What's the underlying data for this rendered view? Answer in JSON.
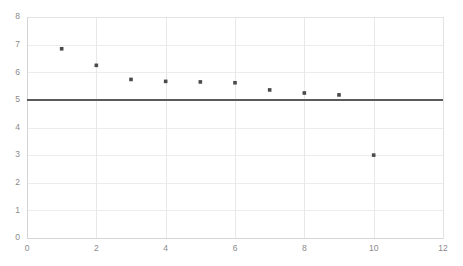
{
  "chart_data": {
    "type": "scatter",
    "title": "",
    "subtitle": "",
    "xlabel": "",
    "ylabel": "",
    "xlim": [
      0,
      12
    ],
    "ylim": [
      0,
      8
    ],
    "x_ticks": [
      0,
      2,
      4,
      6,
      8,
      10,
      12
    ],
    "y_ticks": [
      0,
      1,
      2,
      3,
      4,
      5,
      6,
      7,
      8
    ],
    "x_tick_labels": [
      "0",
      "2",
      "4",
      "6",
      "8",
      "10",
      "12"
    ],
    "y_tick_labels": [
      "0",
      "1",
      "2",
      "3",
      "4",
      "5",
      "6",
      "7",
      "8"
    ],
    "grid": {
      "horizontal": true,
      "vertical": true,
      "horizontal_step": 1,
      "vertical_step": 2,
      "color": "#ececec"
    },
    "legend": {
      "visible": false,
      "position": "none",
      "entries": []
    },
    "series": [
      {
        "name": "points",
        "marker": "square",
        "color": "#4a4a4a",
        "x": [
          1,
          2,
          3,
          4,
          5,
          6,
          7,
          8,
          9,
          10
        ],
        "values": [
          6.85,
          6.25,
          5.74,
          5.67,
          5.65,
          5.62,
          5.36,
          5.25,
          5.18,
          3.0
        ]
      }
    ],
    "reference_lines": [
      {
        "name": "threshold",
        "orientation": "horizontal",
        "value": 5,
        "color": "#5a5a5a",
        "width": 2.2,
        "label": ""
      }
    ],
    "annotations": [],
    "background_color": "#ffffff",
    "plot_area": {
      "left": 27,
      "right": 443,
      "top": 17,
      "bottom": 238
    }
  }
}
